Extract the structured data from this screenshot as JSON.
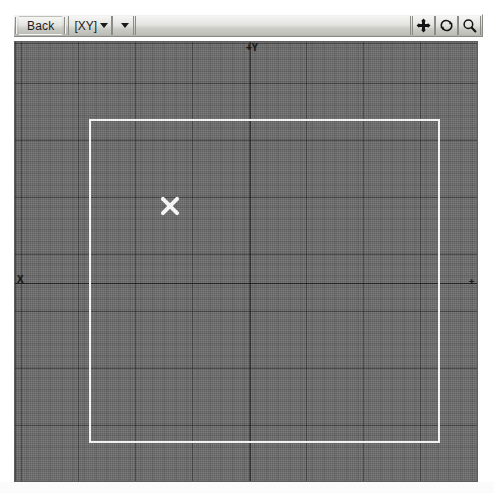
{
  "app": {
    "title": "3D Modeling Viewport"
  },
  "toolbar": {
    "back_label": "Back",
    "view_combo_label": "[XY]",
    "view_combo_caret": "chevron-down",
    "shading_combo_caret": "chevron-down",
    "icons": [
      {
        "name": "pan-icon",
        "label": "Pan"
      },
      {
        "name": "orbit-icon",
        "label": "Orbit"
      },
      {
        "name": "zoom-icon",
        "label": "Zoom"
      }
    ]
  },
  "viewport": {
    "axis_labels": {
      "positive_y": "+Y",
      "negative_x": "X",
      "positive_x": "+"
    },
    "grid": {
      "major_spacing_px": 57,
      "minor_spacing_px": 11,
      "major_color": "#141414",
      "minor_color": "#000000",
      "background_color": "#6d6d6d"
    },
    "selection_rectangle": {
      "name": "work-plane-boundary",
      "color": "#f2f2f2",
      "left": 74,
      "top": 77,
      "width": 351,
      "height": 324
    },
    "cursor_marker": {
      "name": "crosshair-x-marker",
      "color": "#f5f5f5",
      "x": 141,
      "y": 150
    },
    "origin": {
      "x": 235,
      "y": 241
    }
  }
}
